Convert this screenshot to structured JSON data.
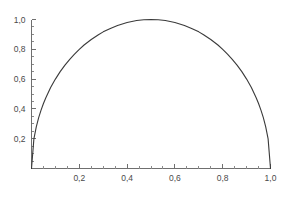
{
  "chart_data": {
    "type": "line",
    "title": "",
    "subtitle": "",
    "xlabel": "",
    "ylabel": "",
    "xlim": [
      0,
      1
    ],
    "ylim": [
      0,
      1
    ],
    "grid": false,
    "legend": null,
    "legend_position": "none",
    "decimal_separator": ",",
    "line_color": "#3a3a3a",
    "axis_color": "#6f6f6f",
    "background_color": "#ffffff",
    "x_ticks": [
      {
        "value": 0.2,
        "label": "0,2"
      },
      {
        "value": 0.4,
        "label": "0,4"
      },
      {
        "value": 0.6,
        "label": "0,6"
      },
      {
        "value": 0.8,
        "label": "0,8"
      },
      {
        "value": 1.0,
        "label": "1,0"
      }
    ],
    "y_ticks": [
      {
        "value": 0.2,
        "label": "0,2"
      },
      {
        "value": 0.4,
        "label": "0,4"
      },
      {
        "value": 0.6,
        "label": "0,6"
      },
      {
        "value": 0.8,
        "label": "0,8"
      },
      {
        "value": 1.0,
        "label": "1,0"
      }
    ],
    "x_minor_tick_step": 0.05,
    "y_minor_tick_step": 0.05,
    "series": [
      {
        "name": "curve",
        "formula": "y = sqrt(4*x*(1-x))",
        "x": [
          0.0,
          0.01,
          0.02,
          0.03,
          0.04,
          0.05,
          0.06,
          0.08,
          0.1,
          0.12,
          0.14,
          0.16,
          0.18,
          0.2,
          0.22,
          0.25,
          0.28,
          0.3,
          0.33,
          0.36,
          0.4,
          0.44,
          0.47,
          0.5,
          0.53,
          0.56,
          0.6,
          0.64,
          0.67,
          0.7,
          0.72,
          0.75,
          0.78,
          0.8,
          0.82,
          0.84,
          0.86,
          0.88,
          0.9,
          0.92,
          0.94,
          0.95,
          0.96,
          0.97,
          0.98,
          0.99,
          1.0
        ],
        "y": [
          0.0,
          0.199,
          0.28,
          0.341,
          0.392,
          0.436,
          0.475,
          0.543,
          0.6,
          0.65,
          0.694,
          0.733,
          0.768,
          0.8,
          0.829,
          0.866,
          0.898,
          0.917,
          0.94,
          0.96,
          0.98,
          0.993,
          0.998,
          1.0,
          0.998,
          0.993,
          0.98,
          0.96,
          0.94,
          0.917,
          0.898,
          0.866,
          0.829,
          0.8,
          0.768,
          0.733,
          0.694,
          0.65,
          0.6,
          0.543,
          0.475,
          0.436,
          0.392,
          0.341,
          0.28,
          0.199,
          0.0
        ]
      }
    ]
  }
}
